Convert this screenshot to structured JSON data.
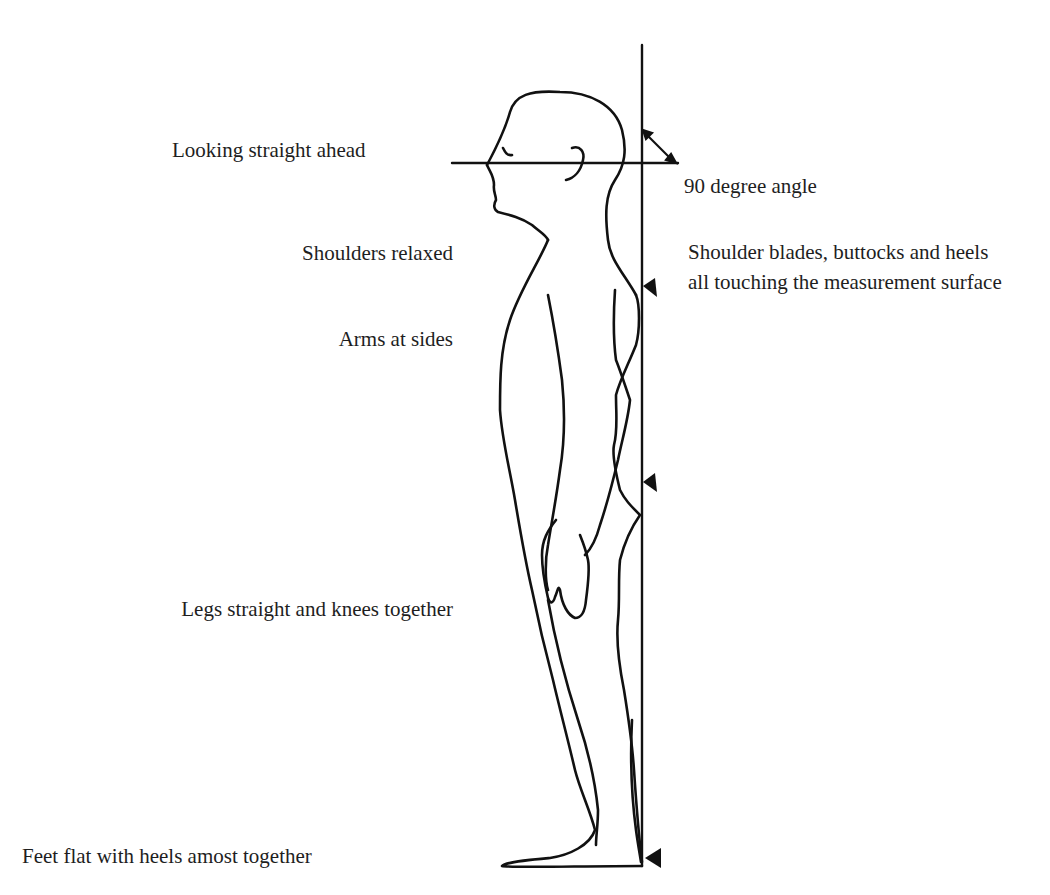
{
  "diagram": {
    "labels": {
      "looking_ahead": "Looking straight ahead",
      "angle": "90 degree angle",
      "shoulders": "Shoulders relaxed",
      "contact_points": "Shoulder blades, buttocks and heels all touching the measurement surface",
      "arms": "Arms at sides",
      "legs": "Legs straight and knees together",
      "feet": "Feet flat with heels amost together"
    },
    "colors": {
      "line": "#111111",
      "text": "#1e1e1e",
      "background": "#ffffff"
    }
  }
}
